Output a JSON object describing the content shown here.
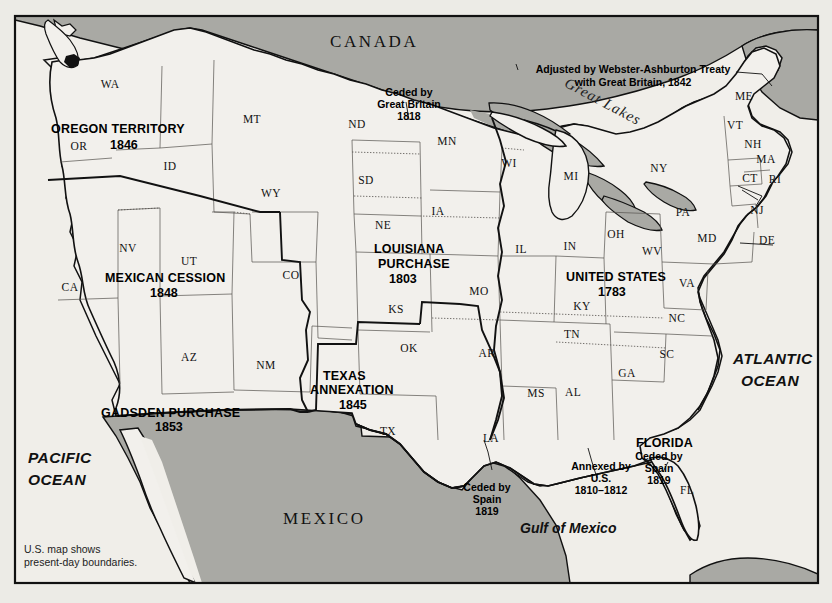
{
  "map": {
    "title": "United States Territorial Expansion",
    "footnote_line1": "U.S. map shows",
    "footnote_line2": "present-day boundaries.",
    "colors": {
      "paper": "#ecebe6",
      "land": "#f2f0ec",
      "foreign_fill": "#a9a9a4",
      "water_fill": "#a9a9a4",
      "ink": "#111111",
      "state_line": "#55524e"
    }
  },
  "countries": [
    {
      "label": "CANADA",
      "x": 330,
      "y": 47
    },
    {
      "label": "MEXICO",
      "x": 283,
      "y": 524
    }
  ],
  "oceans": [
    {
      "label_line1": "PACIFIC",
      "label_line2": "OCEAN",
      "x": 28,
      "y": 463
    },
    {
      "label_line1": "ATLANTIC",
      "label_line2": "OCEAN",
      "x": 733,
      "y": 364
    }
  ],
  "water_labels": [
    {
      "label": "Gulf of Mexico",
      "x": 520,
      "y": 533
    },
    {
      "label": "Great Lakes",
      "x": 590,
      "y": 100
    }
  ],
  "territories": [
    {
      "name": "OREGON TERRITORY",
      "year": "1846",
      "name_x": 51,
      "name_y": 133,
      "year_x": 110,
      "year_y": 149
    },
    {
      "name": "MEXICAN CESSION",
      "year": "1848",
      "name_x": 105,
      "name_y": 282,
      "year_x": 150,
      "year_y": 297
    },
    {
      "name": "GADSDEN PURCHASE",
      "year": "1853",
      "name_x": 101,
      "name_y": 417,
      "year_x": 155,
      "year_y": 431
    },
    {
      "name": "TEXAS",
      "year": "",
      "name_x": 323,
      "name_y": 380,
      "year_x": 0,
      "year_y": 0
    },
    {
      "name": "ANNEXATION",
      "year": "1845",
      "name_x": 310,
      "name_y": 394,
      "year_x": 339,
      "year_y": 409
    },
    {
      "name": "LOUISIANA",
      "year": "",
      "name_x": 374,
      "name_y": 253,
      "year_x": 0,
      "year_y": 0
    },
    {
      "name": "PURCHASE",
      "year": "1803",
      "name_x": 378,
      "name_y": 268,
      "year_x": 389,
      "year_y": 283
    },
    {
      "name": "UNITED STATES",
      "year": "1783",
      "name_x": 566,
      "name_y": 281,
      "year_x": 598,
      "year_y": 296
    },
    {
      "name": "FLORIDA",
      "year": "",
      "name_x": 636,
      "name_y": 447,
      "year_x": 0,
      "year_y": 0
    }
  ],
  "callouts": [
    {
      "id": "ceded-great-britain-1818",
      "lines": [
        "Ceded by",
        "Great Britain",
        "1818"
      ],
      "x": 409,
      "y": 96
    },
    {
      "id": "webster-ashburton-treaty",
      "lines": [
        "Adjusted by Webster-Ashburton Treaty",
        "with Great Britain, 1842"
      ],
      "x": 633,
      "y": 73
    },
    {
      "id": "ceded-by-spain-1819-texas",
      "lines": [
        "Ceded by",
        "Spain",
        "1819"
      ],
      "x": 487,
      "y": 491
    },
    {
      "id": "annexed-by-us-1810-1812",
      "lines": [
        "Annexed by",
        "U.S.",
        "1810–1812"
      ],
      "x": 601,
      "y": 470
    },
    {
      "id": "ceded-by-spain-1819-florida",
      "lines": [
        "Ceded by",
        "Spain",
        "1819"
      ],
      "x": 659,
      "y": 460
    }
  ],
  "states": [
    {
      "abbr": "WA",
      "x": 110,
      "y": 88
    },
    {
      "abbr": "OR",
      "x": 79,
      "y": 150
    },
    {
      "abbr": "ID",
      "x": 170,
      "y": 170
    },
    {
      "abbr": "MT",
      "x": 252,
      "y": 123
    },
    {
      "abbr": "ND",
      "x": 357,
      "y": 128
    },
    {
      "abbr": "MN",
      "x": 447,
      "y": 145
    },
    {
      "abbr": "WI",
      "x": 509,
      "y": 167
    },
    {
      "abbr": "MI",
      "x": 571,
      "y": 180
    },
    {
      "abbr": "NY",
      "x": 659,
      "y": 172
    },
    {
      "abbr": "ME",
      "x": 744,
      "y": 100
    },
    {
      "abbr": "VT",
      "x": 735,
      "y": 129
    },
    {
      "abbr": "NH",
      "x": 753,
      "y": 148
    },
    {
      "abbr": "MA",
      "x": 766,
      "y": 163
    },
    {
      "abbr": "CT",
      "x": 750,
      "y": 182
    },
    {
      "abbr": "RI",
      "x": 775,
      "y": 183
    },
    {
      "abbr": "NJ",
      "x": 757,
      "y": 214
    },
    {
      "abbr": "PA",
      "x": 683,
      "y": 216
    },
    {
      "abbr": "DE",
      "x": 767,
      "y": 244
    },
    {
      "abbr": "MD",
      "x": 707,
      "y": 242
    },
    {
      "abbr": "OH",
      "x": 616,
      "y": 238
    },
    {
      "abbr": "IN",
      "x": 570,
      "y": 250
    },
    {
      "abbr": "IL",
      "x": 521,
      "y": 253
    },
    {
      "abbr": "WV",
      "x": 652,
      "y": 255
    },
    {
      "abbr": "VA",
      "x": 687,
      "y": 287
    },
    {
      "abbr": "KY",
      "x": 582,
      "y": 310
    },
    {
      "abbr": "NC",
      "x": 677,
      "y": 322
    },
    {
      "abbr": "TN",
      "x": 572,
      "y": 338
    },
    {
      "abbr": "SC",
      "x": 667,
      "y": 358
    },
    {
      "abbr": "GA",
      "x": 627,
      "y": 377
    },
    {
      "abbr": "AL",
      "x": 573,
      "y": 396
    },
    {
      "abbr": "MS",
      "x": 536,
      "y": 397
    },
    {
      "abbr": "AR",
      "x": 487,
      "y": 357
    },
    {
      "abbr": "LA",
      "x": 491,
      "y": 442
    },
    {
      "abbr": "MO",
      "x": 479,
      "y": 295
    },
    {
      "abbr": "IA",
      "x": 438,
      "y": 215
    },
    {
      "abbr": "NE",
      "x": 383,
      "y": 229
    },
    {
      "abbr": "SD",
      "x": 366,
      "y": 184
    },
    {
      "abbr": "KS",
      "x": 396,
      "y": 313
    },
    {
      "abbr": "OK",
      "x": 409,
      "y": 352
    },
    {
      "abbr": "TX",
      "x": 388,
      "y": 435
    },
    {
      "abbr": "NM",
      "x": 266,
      "y": 369
    },
    {
      "abbr": "AZ",
      "x": 189,
      "y": 361
    },
    {
      "abbr": "UT",
      "x": 189,
      "y": 265
    },
    {
      "abbr": "CO",
      "x": 291,
      "y": 279
    },
    {
      "abbr": "NV",
      "x": 128,
      "y": 252
    },
    {
      "abbr": "CA",
      "x": 70,
      "y": 291
    },
    {
      "abbr": "WY",
      "x": 271,
      "y": 197
    },
    {
      "abbr": "FL",
      "x": 687,
      "y": 494
    }
  ]
}
